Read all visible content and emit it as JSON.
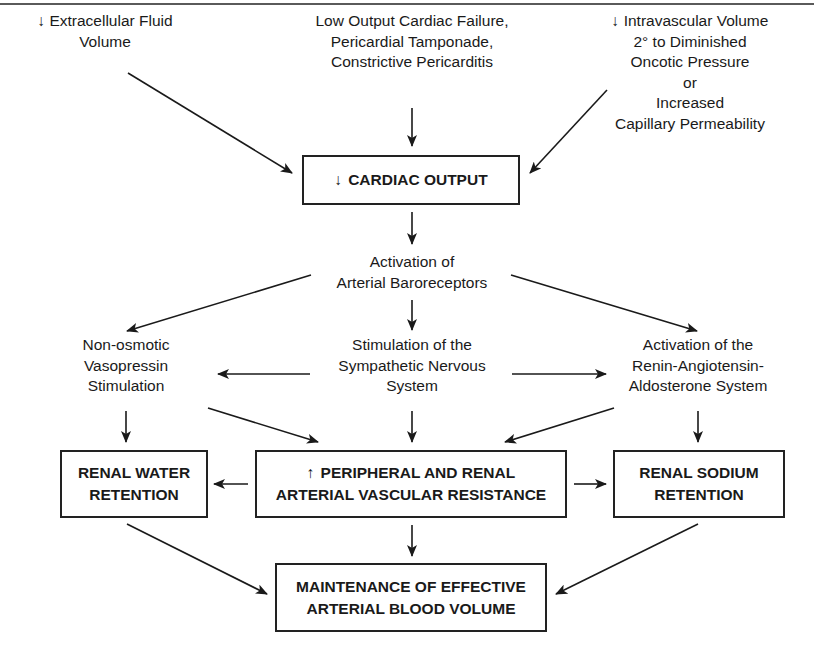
{
  "symbols": {
    "decrease": "↓",
    "increase": "↑"
  },
  "inputs": {
    "left": {
      "lines": [
        "Extracellular Fluid",
        "Volume"
      ],
      "prefix": "↓"
    },
    "center": {
      "lines": [
        "Low Output Cardiac Failure,",
        "Pericardial Tamponade,",
        "Constrictive Pericarditis"
      ]
    },
    "right": {
      "lines": [
        "Intravascular Volume",
        "2° to Diminished",
        "Oncotic Pressure",
        "or",
        "Increased",
        "Capillary Permeability"
      ],
      "prefix": "↓"
    }
  },
  "cardiac_output": {
    "prefix": "↓",
    "label": "CARDIAC OUTPUT"
  },
  "baroreceptors": {
    "lines": [
      "Activation of",
      "Arterial Baroreceptors"
    ]
  },
  "middle_row": {
    "left": {
      "lines": [
        "Non-osmotic",
        "Vasopressin",
        "Stimulation"
      ]
    },
    "center": {
      "lines": [
        "Stimulation of the",
        "Sympathetic Nervous",
        "System"
      ]
    },
    "right": {
      "lines": [
        "Activation of the",
        "Renin-Angiotensin-",
        "Aldosterone System"
      ]
    }
  },
  "effect_boxes": {
    "water": {
      "lines": [
        "RENAL WATER",
        "RETENTION"
      ]
    },
    "resistance": {
      "prefix": "↑",
      "lines": [
        "PERIPHERAL AND RENAL",
        "ARTERIAL VASCULAR RESISTANCE"
      ]
    },
    "sodium": {
      "lines": [
        "RENAL SODIUM",
        "RETENTION"
      ]
    }
  },
  "outcome": {
    "lines": [
      "MAINTENANCE OF EFFECTIVE",
      "ARTERIAL BLOOD VOLUME"
    ]
  },
  "colors": {
    "ink": "#1a1a1a",
    "rule": "#5a5a5a",
    "background": "#ffffff"
  }
}
